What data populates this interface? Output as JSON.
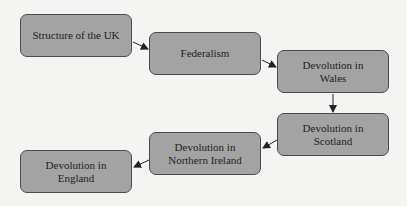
{
  "diagram": {
    "type": "flowchart",
    "colors": {
      "background": "#f4f4f2",
      "node_fill": "#a3a3a3",
      "node_border": "#4a4a4a",
      "arrow": "#222222",
      "text": "#1e1e1e"
    },
    "nodes": [
      {
        "id": "n1",
        "line1": "Structure of the UK",
        "line2": ""
      },
      {
        "id": "n2",
        "line1": "Federalism",
        "line2": ""
      },
      {
        "id": "n3",
        "line1": "Devolution in",
        "line2": "Wales"
      },
      {
        "id": "n4",
        "line1": "Devolution in",
        "line2": "Scotland"
      },
      {
        "id": "n5",
        "line1": "Devolution in",
        "line2": "Northern Ireland"
      },
      {
        "id": "n6",
        "line1": "Devolution in",
        "line2": "England"
      }
    ],
    "edges": [
      {
        "from": "n1",
        "to": "n2"
      },
      {
        "from": "n2",
        "to": "n3"
      },
      {
        "from": "n3",
        "to": "n4"
      },
      {
        "from": "n4",
        "to": "n5"
      },
      {
        "from": "n5",
        "to": "n6"
      }
    ]
  }
}
